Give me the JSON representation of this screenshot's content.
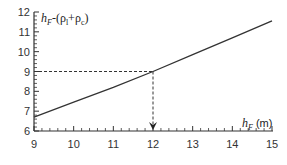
{
  "chart_data": {
    "type": "line",
    "title": "",
    "xlabel": "h_F (m)",
    "xlabel_parts": {
      "var": "h",
      "sub": "F",
      "unit": " (m)"
    },
    "ylabel": "h_F-(ρ_l+ρ_c)",
    "ylabel_parts": {
      "var": "h",
      "sub": "F",
      "rest1": "-(ρ",
      "sub2": "l",
      "rest2": "+ρ",
      "sub3": "c",
      "rest3": ")"
    },
    "xlim": [
      9,
      15
    ],
    "ylim": [
      6,
      12
    ],
    "xticks": [
      9,
      10,
      11,
      12,
      13,
      14,
      15
    ],
    "yticks": [
      6,
      7,
      8,
      9,
      10,
      11,
      12
    ],
    "x_minor_per_major": 5,
    "y_minor_per_major": 5,
    "grid": false,
    "series": [
      {
        "name": "h_F-(ρ_l+ρ_c)",
        "x": [
          9,
          10,
          11,
          12,
          13,
          14,
          15
        ],
        "y": [
          6.7,
          7.45,
          8.2,
          9.0,
          9.85,
          10.7,
          11.55
        ]
      }
    ],
    "annotations": [
      {
        "type": "dashed-guide",
        "x": 12,
        "y": 9,
        "arrow": "down-to-x-axis"
      }
    ]
  }
}
